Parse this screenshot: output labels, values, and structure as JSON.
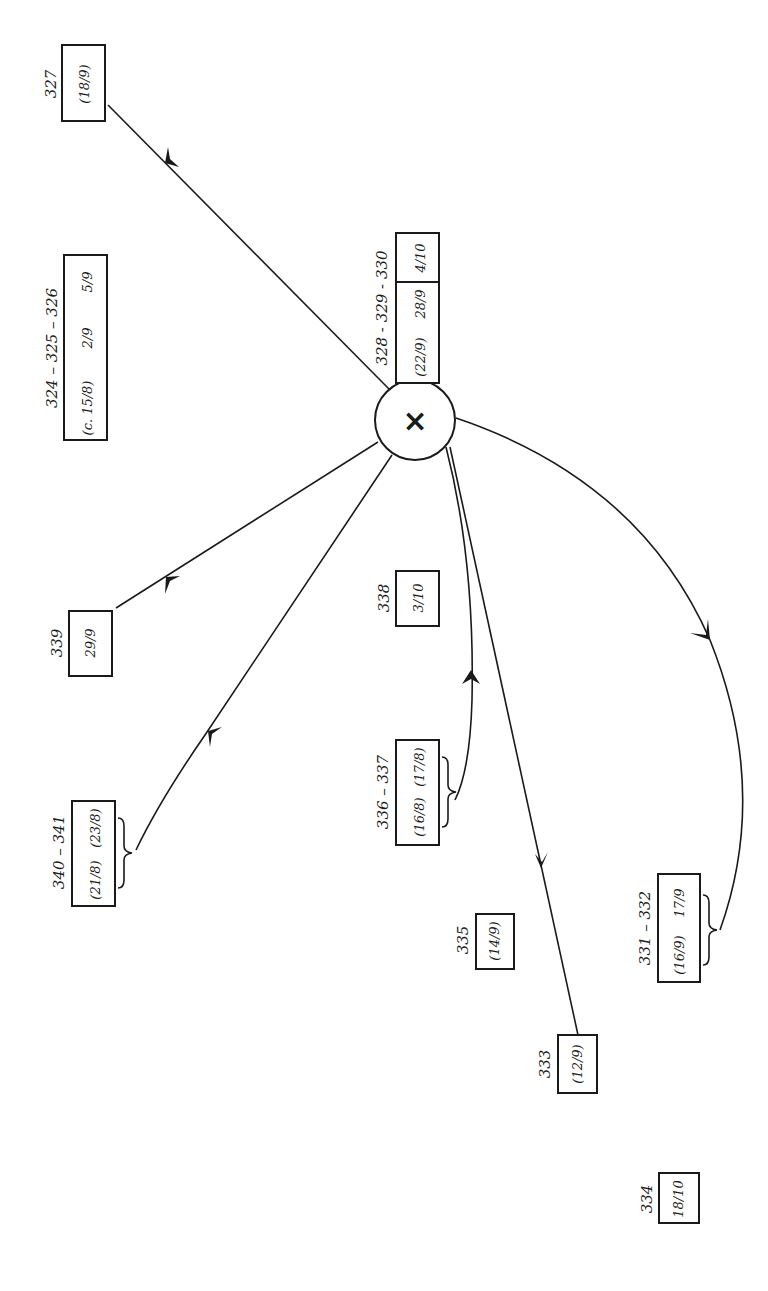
{
  "diagram": {
    "orientation": "rotated 90 degrees counter-clockwise",
    "hub": {
      "symbol": "×"
    },
    "nodes": [
      {
        "id": "n327",
        "label": "327",
        "values": [
          "(18/9)"
        ]
      },
      {
        "id": "n324",
        "label": "324 – 325 – 326",
        "values": [
          "(c. 15/8)",
          "2/9",
          "5/9"
        ]
      },
      {
        "id": "n328",
        "label": "328 - 329 - 330",
        "values": [
          "(22/9)",
          "28/9",
          "4/10"
        ]
      },
      {
        "id": "n339",
        "label": "339",
        "values": [
          "29/9"
        ]
      },
      {
        "id": "n338",
        "label": "338",
        "values": [
          "3/10"
        ]
      },
      {
        "id": "n340",
        "label": "340 – 341",
        "values": [
          "(21/8)",
          "(23/8)"
        ]
      },
      {
        "id": "n336",
        "label": "336 – 337",
        "values": [
          "(16/8)",
          "(17/8)"
        ]
      },
      {
        "id": "n335",
        "label": "335",
        "values": [
          "(14/9)"
        ]
      },
      {
        "id": "n331",
        "label": "331 – 332",
        "values": [
          "(16/9)",
          "17/9"
        ]
      },
      {
        "id": "n333",
        "label": "333",
        "values": [
          "(12/9)"
        ]
      },
      {
        "id": "n334",
        "label": "334",
        "values": [
          "18/10"
        ]
      }
    ],
    "edges": [
      {
        "from": "hub",
        "to": "n327"
      },
      {
        "from": "hub",
        "to": "n339"
      },
      {
        "from": "hub",
        "to": "n340"
      },
      {
        "from": "n336",
        "to": "hub"
      },
      {
        "from": "hub",
        "to": "n333"
      },
      {
        "from": "hub",
        "to": "n331"
      }
    ]
  }
}
